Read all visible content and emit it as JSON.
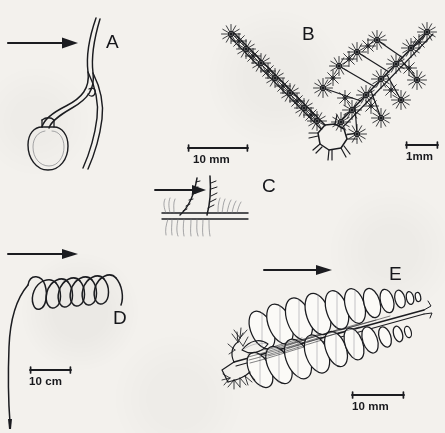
{
  "figure": {
    "background_color": "#f3f1ed",
    "ink_color": "#1b1c20",
    "width": 445,
    "height": 433
  },
  "panels": [
    {
      "id": "A",
      "label": "A",
      "label_x": 106,
      "label_y": 32,
      "subject": "seed with long sinuous hygroscopic awn and bulbous base",
      "arrow": {
        "name": "direction-arrow-a",
        "x": 8,
        "y": 42,
        "length": 62,
        "direction": "right"
      },
      "scale_bar": {
        "value": "10 mm",
        "x": 186,
        "y": 143,
        "bar_length": 62
      }
    },
    {
      "id": "B",
      "label": "B",
      "label_x": 302,
      "label_y": 24,
      "subject": "V-shaped branched diaspore bearing stellate spiny hairs on a polygonal nutlet",
      "arrow": null,
      "scale_bar": {
        "value": "1mm",
        "x": 404,
        "y": 140,
        "bar_length": 34
      }
    },
    {
      "id": "C",
      "label": "C",
      "label_x": 262,
      "label_y": 176,
      "subject": "awned diaspore anchored at the soil surface with roots below",
      "arrow": {
        "name": "direction-arrow-c",
        "x": 155,
        "y": 188,
        "length": 48,
        "direction": "right"
      },
      "scale_bar": null
    },
    {
      "id": "D",
      "label": "D",
      "label_x": 113,
      "label_y": 308,
      "subject": "helically coiled tendril-like dispersal structure",
      "arrow": {
        "name": "direction-arrow-d",
        "x": 8,
        "y": 252,
        "length": 68,
        "direction": "right"
      },
      "scale_bar": {
        "value": "10 cm",
        "x": 28,
        "y": 365,
        "bar_length": 42
      }
    },
    {
      "id": "E",
      "label": "E",
      "label_x": 389,
      "label_y": 264,
      "subject": "pinnate frond with imbricate oval pinnae and feathery basal bracts",
      "arrow": {
        "name": "direction-arrow-e",
        "x": 265,
        "y": 267,
        "length": 66,
        "direction": "right"
      },
      "scale_bar": {
        "value": "10 mm",
        "x": 350,
        "y": 390,
        "bar_length": 52
      }
    }
  ],
  "scale_bars": [
    {
      "panel": "A",
      "value": "10 mm"
    },
    {
      "panel": "B",
      "value": "1mm"
    },
    {
      "panel": "D",
      "value": "10 cm"
    },
    {
      "panel": "E",
      "value": "10 mm"
    }
  ]
}
